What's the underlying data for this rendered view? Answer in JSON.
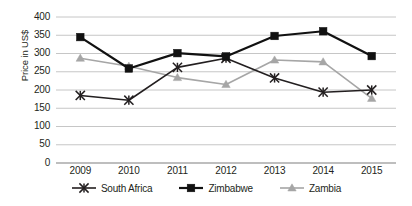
{
  "chart_data": {
    "type": "line",
    "title": "",
    "xlabel": "",
    "ylabel": "Price in US$",
    "categories": [
      "2009",
      "2010",
      "2011",
      "2012",
      "2013",
      "2014",
      "2015"
    ],
    "ylim": [
      0,
      400
    ],
    "yticks": [
      0,
      50,
      100,
      150,
      200,
      250,
      300,
      350,
      400
    ],
    "ytick_labels": [
      "0",
      "50",
      "100",
      "150",
      "200",
      "250",
      "300",
      "350",
      "400"
    ],
    "grid": true,
    "legend_position": "bottom",
    "series": [
      {
        "name": "South Africa",
        "marker": "x-cross",
        "color": "#231f20",
        "values": [
          185,
          172,
          262,
          287,
          233,
          194,
          200
        ]
      },
      {
        "name": "Zimbabwe",
        "marker": "square",
        "color": "#111111",
        "values": [
          345,
          259,
          301,
          292,
          348,
          361,
          293
        ]
      },
      {
        "name": "Zambia",
        "marker": "triangle",
        "color": "#a6a6a6",
        "values": [
          287,
          265,
          234,
          215,
          282,
          277,
          177
        ]
      }
    ]
  },
  "axis": {
    "y_title": "Price in US$"
  },
  "legend": {
    "items": [
      {
        "label": "South Africa"
      },
      {
        "label": "Zimbabwe"
      },
      {
        "label": "Zambia"
      }
    ]
  },
  "colors": {
    "grid": "#bfbfbf",
    "axis_text": "#231f20",
    "south_africa": "#231f20",
    "zimbabwe": "#111111",
    "zambia": "#a6a6a6"
  }
}
